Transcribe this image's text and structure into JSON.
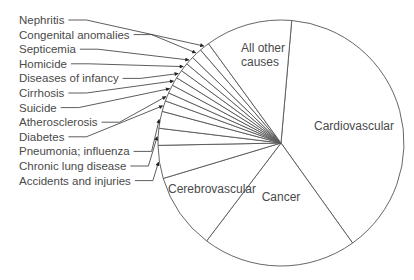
{
  "chart_data": {
    "type": "pie",
    "title": "",
    "start_angle_deg": 5,
    "direction": "clockwise",
    "unit": "percent",
    "slices": [
      {
        "label": "Cardiovascular",
        "value": 38.3,
        "label_inside": true
      },
      {
        "label": "Cancer",
        "value": 20.0,
        "label_inside": true
      },
      {
        "label": "Cerebrovascular",
        "value": 9.9,
        "label_inside": true
      },
      {
        "label": "Accidents and injuries",
        "value": 4.3,
        "label_inside": false
      },
      {
        "label": "Chronic lung disease",
        "value": 2.2,
        "label_inside": false
      },
      {
        "label": "Pneumonia; influenza",
        "value": 2.2,
        "label_inside": false
      },
      {
        "label": "Diabetes",
        "value": 1.4,
        "label_inside": false
      },
      {
        "label": "Atherosclerosis",
        "value": 1.1,
        "label_inside": false
      },
      {
        "label": "Suicide",
        "value": 1.1,
        "label_inside": false
      },
      {
        "label": "Cirrhosis",
        "value": 1.1,
        "label_inside": false
      },
      {
        "label": "Diseases of infancy",
        "value": 1.1,
        "label_inside": false
      },
      {
        "label": "Homicide",
        "value": 1.1,
        "label_inside": false
      },
      {
        "label": "Septicemia",
        "value": 1.1,
        "label_inside": false
      },
      {
        "label": "Congenital anomalies",
        "value": 1.4,
        "label_inside": false
      },
      {
        "label": "Nephritis",
        "value": 1.3,
        "label_inside": false
      },
      {
        "label": "All other causes",
        "value": 11.3,
        "label_inside": true
      }
    ],
    "legend_order_top_to_bottom": [
      "Nephritis",
      "Congenital anomalies",
      "Septicemia",
      "Homicide",
      "Diseases of infancy",
      "Cirrhosis",
      "Suicide",
      "Atherosclerosis",
      "Diabetes",
      "Pneumonia; influenza",
      "Chronic lung disease",
      "Accidents and injuries"
    ],
    "inside_labels": {
      "Cardiovascular": [
        "Cardiovascular"
      ],
      "Cancer": [
        "Cancer"
      ],
      "Cerebrovascular": [
        "Cerebrovascular"
      ],
      "All other causes": [
        "All other",
        "causes"
      ]
    },
    "colors": {
      "stroke": "#555555",
      "fill": "#ffffff",
      "text": "#4a4a4a"
    }
  }
}
